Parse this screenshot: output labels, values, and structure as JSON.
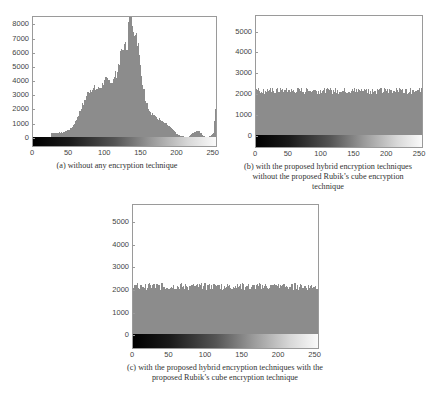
{
  "chart_data": [
    {
      "id": "a",
      "type": "bar",
      "title": "",
      "caption": "(a) without any encryption technique",
      "xlabel": "",
      "ylabel": "",
      "xlim": [
        0,
        256
      ],
      "ylim": [
        -650,
        8600
      ],
      "x_ticks": [
        0,
        50,
        100,
        150,
        200,
        250
      ],
      "y_ticks": [
        0,
        1000,
        2000,
        3000,
        4000,
        5000,
        6000,
        7000,
        8000
      ],
      "grid": false,
      "colorbar": "grayscale 0-255 below axis",
      "profile_x": [
        0,
        24,
        25,
        30,
        40,
        50,
        55,
        60,
        65,
        70,
        75,
        80,
        85,
        90,
        95,
        100,
        105,
        110,
        115,
        120,
        125,
        130,
        133,
        136,
        140,
        145,
        150,
        155,
        160,
        165,
        170,
        175,
        180,
        185,
        190,
        195,
        200,
        205,
        210,
        215,
        220,
        225,
        230,
        235,
        240,
        245,
        250,
        252,
        254,
        255
      ],
      "profile_y": [
        0,
        0,
        400,
        400,
        450,
        650,
        900,
        1400,
        2000,
        2600,
        3200,
        3500,
        3550,
        3500,
        3800,
        4100,
        4100,
        4000,
        4600,
        5800,
        6400,
        6600,
        8700,
        8700,
        7400,
        6800,
        4200,
        2800,
        2000,
        1700,
        1500,
        1400,
        1200,
        1000,
        800,
        500,
        250,
        200,
        100,
        150,
        400,
        550,
        500,
        200,
        100,
        200,
        500,
        2100,
        1700,
        1000
      ]
    },
    {
      "id": "b",
      "type": "bar",
      "title": "",
      "caption": "(b) with the proposed hybrid encryption techniques without the proposed Rubik's cube encryption technique",
      "caption_lines": [
        "(b) with the proposed hybrid encryption techniques",
        "without the proposed Rubik's cube encryption",
        "technique"
      ],
      "xlabel": "",
      "ylabel": "",
      "xlim": [
        0,
        256
      ],
      "ylim": [
        -600,
        5800
      ],
      "x_ticks": [
        0,
        50,
        100,
        150,
        200,
        250
      ],
      "y_ticks": [
        0,
        1000,
        2000,
        3000,
        4000,
        5000
      ],
      "grid": false,
      "colorbar": "grayscale 0-255 below axis",
      "uniform_level": 2200,
      "uniform_jitter": 150
    },
    {
      "id": "c",
      "type": "bar",
      "title": "",
      "caption": "(c) with the proposed hybrid encryption techniques with the proposed Rubik's cube encryption technique",
      "caption_lines": [
        "(c) with the proposed hybrid encryption techniques with the",
        "proposed Rubik's cube encryption technique"
      ],
      "xlabel": "",
      "ylabel": "",
      "xlim": [
        0,
        256
      ],
      "ylim": [
        -600,
        5800
      ],
      "x_ticks": [
        0,
        50,
        100,
        150,
        200,
        250
      ],
      "y_ticks": [
        0,
        1000,
        2000,
        3000,
        4000,
        5000
      ],
      "grid": false,
      "colorbar": "grayscale 0-255 below axis",
      "uniform_level": 2200,
      "uniform_jitter": 150
    }
  ],
  "panels": {
    "a": {
      "caption": "(a) without any encryption technique"
    },
    "b": {
      "caption_1": "(b) with the proposed hybrid encryption techniques",
      "caption_2": "without the proposed Rubik’s cube encryption",
      "caption_3": "technique"
    },
    "c": {
      "caption_1": "(c) with the proposed hybrid encryption techniques with the",
      "caption_2": "proposed Rubik’s cube encryption technique"
    }
  },
  "colors": {
    "bar": "#8c8c8c",
    "axis": "#9a9a9a",
    "text": "#333333"
  }
}
